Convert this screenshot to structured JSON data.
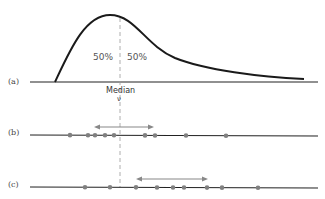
{
  "diagram": {
    "panels": [
      {
        "id": "a",
        "label": "(a)"
      },
      {
        "id": "b",
        "label": "(b)"
      },
      {
        "id": "c",
        "label": "(c)"
      }
    ],
    "curve": {
      "left_percent": "50%",
      "right_percent": "50%",
      "median_label": "Median",
      "median_symbol": "ν"
    },
    "row_b": {
      "points_x": [
        70,
        88,
        95,
        105,
        114,
        145,
        155,
        186,
        226
      ],
      "arrow": [
        95,
        153
      ]
    },
    "row_c": {
      "points_x": [
        85,
        110,
        136,
        157,
        173,
        184,
        207,
        222,
        258
      ],
      "arrow": [
        137,
        207
      ]
    },
    "colors": {
      "curve": "#1a1a1a",
      "axis": "#222222",
      "dots": "#808080",
      "arrow": "#888888",
      "dashed": "#999999"
    }
  }
}
